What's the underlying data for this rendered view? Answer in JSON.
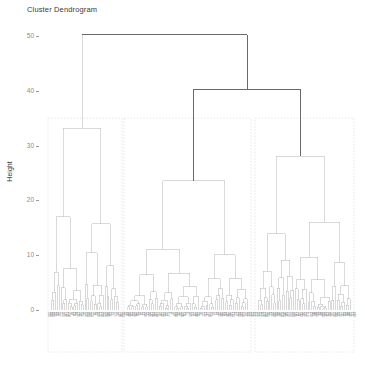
{
  "plot": {
    "title": "Cluster Dendrogram",
    "type": "dendrogram",
    "y_axis_label": "Height",
    "x_axis_label": "",
    "background": "#ffffff",
    "link_color": "#b9b9b9",
    "root_link_color": "#5a5a5a",
    "box_color": "#d8d8d8",
    "tick_color": "#8c8c8c"
  },
  "chart_data": {
    "type": "dendrogram",
    "title": "Cluster Dendrogram",
    "xlabel": "",
    "ylabel": "Height",
    "ylim": [
      0,
      52
    ],
    "yticks": [
      0,
      10,
      20,
      30,
      40,
      50
    ],
    "ytick_labels": [
      "0",
      "10",
      "20",
      "30",
      "40",
      "50"
    ],
    "grid": false,
    "legend": "none",
    "n_leaves": 150,
    "n_clusters": 3,
    "cut_height": 35,
    "root_height": 50.2,
    "cluster_boxes": [
      {
        "id": 1,
        "leaf_start": 0,
        "leaf_end": 36,
        "top_height": 33.2,
        "x_left_px": 48,
        "x_right_px": 122,
        "color": "#d8d8d8"
      },
      {
        "id": 2,
        "leaf_start": 37,
        "leaf_end": 98,
        "top_height": 23.6,
        "x_left_px": 124,
        "x_right_px": 251,
        "color": "#d8d8d8"
      },
      {
        "id": 3,
        "leaf_start": 99,
        "leaf_end": 149,
        "top_height": 28.1,
        "x_left_px": 255,
        "x_right_px": 354,
        "color": "#d8d8d8"
      }
    ],
    "top_merges": [
      {
        "label": "root",
        "height": 50.2,
        "left_x_px": 72,
        "right_x_px": 220,
        "emphasis": true
      },
      {
        "label": "right-pair",
        "height": 40.3,
        "left_x_px": 159,
        "right_x_px": 281,
        "emphasis": true
      },
      {
        "label": "cluster-1",
        "height": 33.2,
        "left_x_px": 72,
        "right_x_px": 72,
        "emphasis": false
      },
      {
        "label": "cluster-2",
        "height": 23.6,
        "left_x_px": 159,
        "right_x_px": 159,
        "emphasis": false
      },
      {
        "label": "cluster-3",
        "height": 28.1,
        "left_x_px": 281,
        "right_x_px": 281,
        "emphasis": false
      }
    ],
    "geometry": {
      "plot_left_px": 48,
      "plot_right_px": 355,
      "baseline_y_px": 310,
      "top_y_px": 36,
      "units_per_px": 0.1825,
      "leaf_spacing_px": 2.06
    },
    "heights_by_cluster": {
      "cluster_1": [
        33.2,
        26.4,
        19.3,
        20.5,
        15.1,
        11.6,
        12.4,
        9.8,
        8.1,
        7.2,
        6.4,
        5.5,
        4.8,
        4.1,
        3.6,
        3.0,
        2.6,
        2.2,
        1.8,
        1.5,
        1.2,
        1.0
      ],
      "cluster_2": [
        23.6,
        19.0,
        17.6,
        14.5,
        12.0,
        10.4,
        9.1,
        7.9,
        6.8,
        5.9,
        5.1,
        4.4,
        3.8,
        3.2,
        2.7,
        2.3,
        1.9,
        1.6,
        1.3,
        1.0
      ],
      "cluster_3": [
        28.1,
        20.6,
        15.3,
        11.2,
        9.4,
        8.2,
        7.0,
        6.1,
        5.3,
        4.6,
        3.9,
        3.3,
        2.8,
        2.4,
        2.0,
        1.6,
        1.3,
        1.1,
        0.9
      ]
    }
  },
  "leaf_labels": {
    "visible": true,
    "note": "rotated sample id tick labels along the baseline",
    "font_size_px": 2.6
  }
}
